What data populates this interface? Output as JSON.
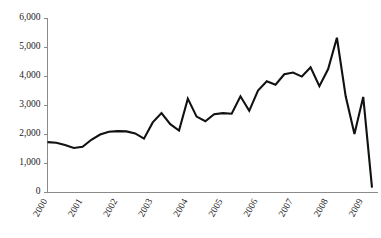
{
  "chart_data": {
    "type": "line",
    "title": "",
    "subtitle": "",
    "xlabel": "",
    "ylabel": "",
    "ylim": [
      0,
      6000
    ],
    "xlim": [
      2000,
      2009.25
    ],
    "grid": false,
    "legend": false,
    "legend_position": "none",
    "y_ticks": [
      0,
      1000,
      2000,
      3000,
      4000,
      5000,
      6000
    ],
    "y_tick_labels": [
      "0",
      "1,000",
      "2,000",
      "3,000",
      "4,000",
      "5,000",
      "6,000"
    ],
    "x_ticks": [
      2000,
      2001,
      2002,
      2003,
      2004,
      2005,
      2006,
      2007,
      2008,
      2009
    ],
    "x_tick_labels": [
      "2000",
      "2001",
      "2002",
      "2003",
      "2004",
      "2005",
      "2006",
      "2007",
      "2008",
      "2009"
    ],
    "line_color": "#111111",
    "axis_color": "#8a8a8a",
    "series": [
      {
        "name": "series-1",
        "x": [
          2000.0,
          2000.25,
          2000.5,
          2000.75,
          2001.0,
          2001.25,
          2001.5,
          2001.75,
          2002.0,
          2002.25,
          2002.5,
          2002.75,
          2003.0,
          2003.25,
          2003.5,
          2003.75,
          2004.0,
          2004.25,
          2004.5,
          2004.75,
          2005.0,
          2005.25,
          2005.5,
          2005.75,
          2006.0,
          2006.25,
          2006.5,
          2006.75,
          2007.0,
          2007.25,
          2007.5,
          2007.75,
          2008.0,
          2008.25,
          2008.5,
          2008.75,
          2009.0
        ],
        "values": [
          1720,
          1700,
          1620,
          1520,
          1560,
          1800,
          1980,
          2080,
          2100,
          2090,
          2020,
          1840,
          2400,
          2720,
          2340,
          2120,
          3220,
          2600,
          2440,
          2680,
          2720,
          2700,
          3300,
          2800,
          3500,
          3820,
          3700,
          4060,
          4120,
          3980,
          4300,
          3650,
          4240,
          5320,
          3300,
          2000,
          3280
        ]
      }
    ],
    "annotations": [
      {
        "label": "peak",
        "x": 2008.25,
        "y": 5320
      },
      {
        "label": "final-value",
        "x": 2009.25,
        "y": 150
      }
    ],
    "tail": {
      "x": 2009.25,
      "y": 150
    }
  }
}
